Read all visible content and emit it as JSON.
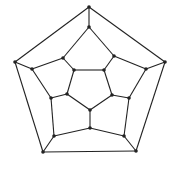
{
  "diagram": {
    "type": "graph",
    "name": "dodecahedral graph",
    "colors": {
      "edge": "#222222",
      "node": "#222222",
      "background": "#ffffff"
    },
    "node_radius": 1.8,
    "edge_width": 1.1,
    "nodes": [
      {
        "id": 0,
        "x": 89,
        "y": 7
      },
      {
        "id": 1,
        "x": 165,
        "y": 62
      },
      {
        "id": 2,
        "x": 136,
        "y": 151
      },
      {
        "id": 3,
        "x": 43,
        "y": 152
      },
      {
        "id": 4,
        "x": 15,
        "y": 62
      },
      {
        "id": 5,
        "x": 89,
        "y": 27
      },
      {
        "id": 6,
        "x": 114,
        "y": 56
      },
      {
        "id": 7,
        "x": 146,
        "y": 69
      },
      {
        "id": 8,
        "x": 129,
        "y": 98
      },
      {
        "id": 9,
        "x": 124,
        "y": 136
      },
      {
        "id": 10,
        "x": 90,
        "y": 128
      },
      {
        "id": 11,
        "x": 54,
        "y": 136
      },
      {
        "id": 12,
        "x": 51,
        "y": 98
      },
      {
        "id": 13,
        "x": 32,
        "y": 69
      },
      {
        "id": 14,
        "x": 63,
        "y": 58
      },
      {
        "id": 15,
        "x": 104,
        "y": 70
      },
      {
        "id": 16,
        "x": 112,
        "y": 95
      },
      {
        "id": 17,
        "x": 90,
        "y": 110
      },
      {
        "id": 18,
        "x": 67,
        "y": 94
      },
      {
        "id": 19,
        "x": 74,
        "y": 70
      }
    ],
    "edges": [
      [
        0,
        1
      ],
      [
        1,
        2
      ],
      [
        2,
        3
      ],
      [
        3,
        4
      ],
      [
        4,
        0
      ],
      [
        0,
        5
      ],
      [
        1,
        7
      ],
      [
        2,
        9
      ],
      [
        3,
        11
      ],
      [
        4,
        13
      ],
      [
        5,
        6
      ],
      [
        6,
        7
      ],
      [
        7,
        8
      ],
      [
        8,
        9
      ],
      [
        9,
        10
      ],
      [
        10,
        11
      ],
      [
        11,
        12
      ],
      [
        12,
        13
      ],
      [
        13,
        14
      ],
      [
        14,
        5
      ],
      [
        6,
        15
      ],
      [
        8,
        16
      ],
      [
        10,
        17
      ],
      [
        12,
        18
      ],
      [
        14,
        19
      ],
      [
        15,
        16
      ],
      [
        16,
        17
      ],
      [
        17,
        18
      ],
      [
        18,
        19
      ],
      [
        19,
        15
      ]
    ]
  }
}
